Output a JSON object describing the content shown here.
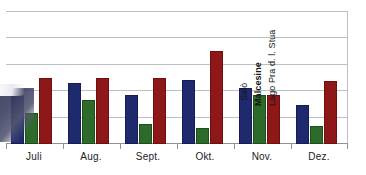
{
  "chart_data": {
    "type": "bar",
    "title": "",
    "xlabel": "",
    "ylabel": "",
    "grid": true,
    "legend_position": "inside-plot-rotated",
    "ylim": [
      0,
      5
    ],
    "yticks": [
      0,
      1,
      2,
      3,
      4,
      5
    ],
    "categories": [
      "Juli",
      "Aug.",
      "Sept.",
      "Okt.",
      "Nov.",
      "Dez."
    ],
    "series": [
      {
        "name": "Salò",
        "color": "#1f2a6e",
        "values": [
          1.85,
          2.3,
          1.85,
          2.42,
          2.12,
          1.46
        ]
      },
      {
        "name": "Malcesine",
        "color": "#2d6b2a",
        "values": [
          1.15,
          1.65,
          0.77,
          0.62,
          1.85,
          0.69
        ]
      },
      {
        "name": "Lago Pra d. l. Stua",
        "color": "#8e1818",
        "values": [
          2.5,
          2.5,
          2.5,
          3.5,
          1.85,
          2.38
        ]
      }
    ]
  },
  "axis": {
    "categories": [
      "Juli",
      "Aug.",
      "Sept.",
      "Okt.",
      "Nov.",
      "Dez."
    ]
  },
  "legend": {
    "items": [
      {
        "label": "Salò"
      },
      {
        "label": "Malcesine"
      },
      {
        "label": "Lago Pra d. l. Stua"
      }
    ]
  }
}
